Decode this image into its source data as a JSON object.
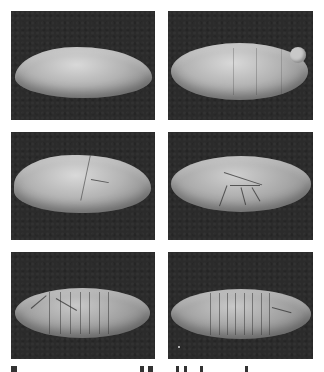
{
  "figure": {
    "layout": {
      "rows": 3,
      "columns": 2
    },
    "colors": {
      "background": "#ffffff",
      "panel": "#2b2b2b",
      "specimen": "#b3b3b3"
    },
    "panels": [
      {
        "row": 1,
        "col": 1,
        "description": "smooth egg, early stage"
      },
      {
        "row": 1,
        "col": 2,
        "description": "egg with faint transverse furrows, pole cell cap at right"
      },
      {
        "row": 2,
        "col": 1,
        "description": "egg with cephalic furrow"
      },
      {
        "row": 2,
        "col": 2,
        "description": "egg with branching dorsal folds"
      },
      {
        "row": 3,
        "col": 1,
        "description": "segmented embryo with many grooves"
      },
      {
        "row": 3,
        "col": 2,
        "description": "segmented embryo with regular segment grooves"
      }
    ],
    "caption": {
      "visible": "partially",
      "note": "caption text cut off at bottom edge; unreadable"
    }
  }
}
